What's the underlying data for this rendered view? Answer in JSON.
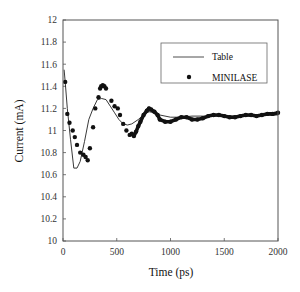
{
  "chart_data": {
    "type": "line",
    "title": "",
    "xlabel": "Time (ps)",
    "ylabel": "Current (mA)",
    "xlim": [
      0,
      2000
    ],
    "ylim": [
      10,
      12
    ],
    "xticks": [
      0,
      500,
      1000,
      1500,
      2000
    ],
    "xtick_labels": [
      "0",
      "500",
      "1000",
      "1500",
      "2000"
    ],
    "yticks": [
      10,
      10.2,
      10.4,
      10.6,
      10.8,
      11,
      11.2,
      11.4,
      11.6,
      11.8,
      12
    ],
    "ytick_labels": [
      "10",
      "10.2",
      "10.4",
      "10.6",
      "10.8",
      "11",
      "11.2",
      "11.4",
      "11.6",
      "11.8",
      "12"
    ],
    "grid": false,
    "legend_position": "upper right (inset box)",
    "series": [
      {
        "name": "Table",
        "style": "line",
        "color": "#222222",
        "x": [
          10,
          20,
          40,
          70,
          100,
          130,
          160,
          200,
          240,
          280,
          320,
          360,
          400,
          440,
          480,
          520,
          560,
          600,
          640,
          700,
          760,
          800,
          850,
          900,
          1000,
          1100,
          1200,
          1300,
          1400,
          1500,
          1600,
          1700,
          1800,
          1900,
          2000
        ],
        "y": [
          11.55,
          11.44,
          11.2,
          10.92,
          10.66,
          10.66,
          10.72,
          10.9,
          11.1,
          11.2,
          11.28,
          11.29,
          11.28,
          11.22,
          11.16,
          11.1,
          11.06,
          11.05,
          11.06,
          11.1,
          11.15,
          11.17,
          11.16,
          11.14,
          11.12,
          11.12,
          11.13,
          11.13,
          11.13,
          11.13,
          11.13,
          11.13,
          11.13,
          11.14,
          11.14
        ]
      },
      {
        "name": "MINILASE",
        "style": "markers",
        "color": "#111111",
        "x": [
          20,
          40,
          60,
          90,
          110,
          130,
          160,
          190,
          210,
          230,
          250,
          280,
          300,
          330,
          345,
          355,
          370,
          385,
          400,
          450,
          480,
          510,
          530,
          560,
          590,
          620,
          640,
          660,
          680,
          700,
          720,
          750,
          780,
          800,
          820,
          850,
          880,
          900,
          950,
          1000,
          1050,
          1100,
          1150,
          1200,
          1250,
          1300,
          1350,
          1400,
          1450,
          1500,
          1550,
          1600,
          1650,
          1700,
          1750,
          1800,
          1850,
          1900,
          1950,
          2000
        ],
        "y": [
          11.44,
          11.15,
          11.07,
          11.0,
          10.94,
          10.87,
          10.8,
          10.78,
          10.76,
          10.73,
          10.84,
          11.03,
          11.2,
          11.3,
          11.38,
          11.4,
          11.41,
          11.4,
          11.38,
          11.27,
          11.22,
          11.2,
          11.14,
          11.06,
          11.0,
          10.96,
          10.97,
          10.95,
          10.99,
          11.04,
          11.08,
          11.14,
          11.18,
          11.2,
          11.19,
          11.17,
          11.14,
          11.1,
          11.08,
          11.08,
          11.1,
          11.12,
          11.12,
          11.1,
          11.1,
          11.11,
          11.13,
          11.14,
          11.14,
          11.13,
          11.12,
          11.12,
          11.13,
          11.14,
          11.14,
          11.13,
          11.14,
          11.15,
          11.15,
          11.16
        ]
      }
    ]
  },
  "legend": {
    "entries": [
      {
        "label": "Table",
        "symbol": "line"
      },
      {
        "label": "MINILASE",
        "symbol": "dot"
      }
    ]
  },
  "axes": {
    "xlabel": "Time (ps)",
    "ylabel": "Current (mA)"
  }
}
